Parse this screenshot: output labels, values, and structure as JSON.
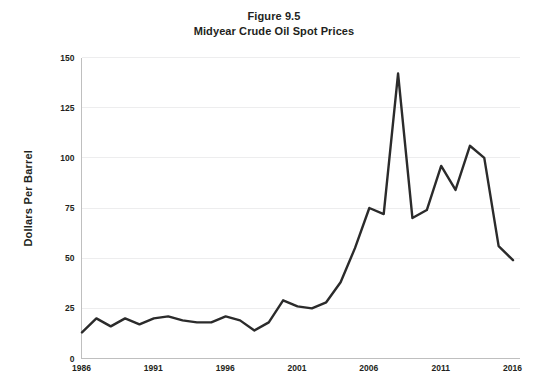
{
  "chart_data": {
    "type": "line",
    "title": "Figure 9.5",
    "subtitle": "Midyear Crude Oil Spot Prices",
    "xlabel": "",
    "ylabel": "Dollars Per Barrel",
    "ylim": [
      0,
      150
    ],
    "xlim": [
      1986,
      2016
    ],
    "yticks": [
      0,
      25,
      50,
      75,
      100,
      125,
      150
    ],
    "ytick_labels": [
      "0",
      "25",
      "50",
      "75",
      "100",
      "125",
      "150"
    ],
    "xticks": [
      1986,
      1991,
      1996,
      2001,
      2006,
      2011,
      2016
    ],
    "xtick_labels": [
      "1986",
      "1991",
      "1996",
      "2001",
      "2006",
      "2011",
      "2016"
    ],
    "grid": "horizontal",
    "legend": "none",
    "series": [
      {
        "name": "Midyear crude oil spot price",
        "color": "#2b2b2b",
        "x": [
          1986,
          1987,
          1988,
          1989,
          1990,
          1991,
          1992,
          1993,
          1994,
          1995,
          1996,
          1997,
          1998,
          1999,
          2000,
          2001,
          2002,
          2003,
          2004,
          2005,
          2006,
          2007,
          2008,
          2009,
          2010,
          2011,
          2012,
          2013,
          2014,
          2015,
          2016
        ],
        "values": [
          13,
          20,
          16,
          20,
          17,
          20,
          21,
          19,
          18,
          18,
          21,
          19,
          14,
          18,
          29,
          26,
          25,
          28,
          38,
          55,
          75,
          72,
          142,
          70,
          74,
          96,
          84,
          106,
          100,
          56,
          49
        ]
      }
    ]
  },
  "axis": {
    "y_title": "Dollars Per Barrel"
  }
}
